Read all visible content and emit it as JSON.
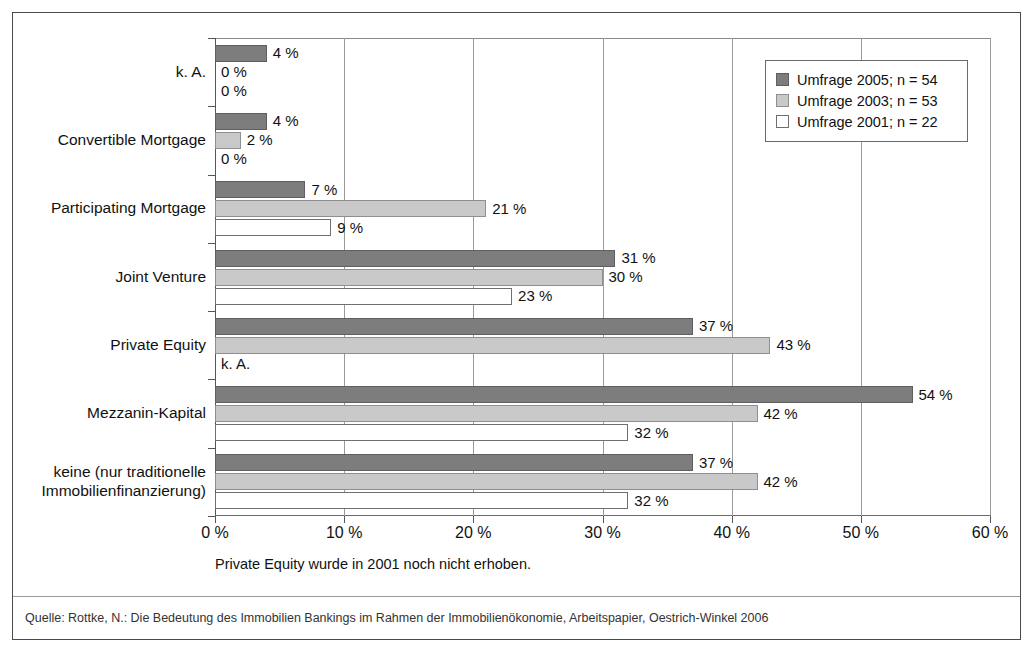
{
  "chart_data": {
    "type": "bar",
    "orientation": "horizontal",
    "title": "",
    "xlabel": "",
    "ylabel": "",
    "xlim": [
      0,
      60
    ],
    "xticks": [
      0,
      10,
      20,
      30,
      40,
      50,
      60
    ],
    "xtick_labels": [
      "0 %",
      "10 %",
      "20 %",
      "30 %",
      "40 %",
      "50 %",
      "60 %"
    ],
    "grid": true,
    "legend_position": "top-right",
    "categories": [
      "k. A.",
      "Convertible Mortgage",
      "Participating Mortgage",
      "Joint Venture",
      "Private Equity",
      "Mezzanin-Kapital",
      "keine (nur traditionelle\nImmobilienfinanzierung)"
    ],
    "series": [
      {
        "name": "Umfrage 2005; n = 54",
        "color": "#7d7d7d",
        "values": [
          4,
          4,
          7,
          31,
          37,
          54,
          37
        ],
        "labels": [
          "4 %",
          "4 %",
          "7 %",
          "31 %",
          "37 %",
          "54 %",
          "37 %"
        ]
      },
      {
        "name": "Umfrage 2003; n = 53",
        "color": "#c9c9c9",
        "values": [
          0,
          2,
          21,
          30,
          43,
          42,
          42
        ],
        "labels": [
          "0 %",
          "2 %",
          "21 %",
          "30 %",
          "43 %",
          "42 %",
          "42 %"
        ]
      },
      {
        "name": "Umfrage 2001; n = 22",
        "color": "#ffffff",
        "values": [
          0,
          0,
          9,
          23,
          null,
          32,
          32
        ],
        "labels": [
          "0 %",
          "0 %",
          "9 %",
          "23 %",
          "k. A.",
          "32 %",
          "32 %"
        ]
      }
    ],
    "footnote": "Private Equity wurde in 2001 noch nicht erhoben.",
    "source": "Quelle: Rottke, N.: Die Bedeutung des Immobilien Bankings im Rahmen der Immobilienökonomie, Arbeitspapier, Oestrich-Winkel 2006"
  },
  "legend": {
    "items": [
      {
        "label": "Umfrage 2005; n = 54",
        "series_key": "s2005"
      },
      {
        "label": "Umfrage 2003; n = 53",
        "series_key": "s2003"
      },
      {
        "label": "Umfrage 2001; n = 22",
        "series_key": "s2001"
      }
    ]
  },
  "axis": {
    "tick_labels": [
      "0 %",
      "10 %",
      "20 %",
      "30 %",
      "40 %",
      "50 %",
      "60 %"
    ]
  },
  "category_labels": [
    "k. A.",
    "Convertible Mortgage",
    "Participating Mortgage",
    "Joint Venture",
    "Private Equity",
    "Mezzanin-Kapital",
    "keine (nur traditionelle\nImmobilienfinanzierung)"
  ],
  "footnote_text": "Private Equity wurde in 2001 noch nicht erhoben.",
  "source_text": "Quelle: Rottke, N.: Die Bedeutung des Immobilien Bankings im Rahmen der Immobilienökonomie, Arbeitspapier, Oestrich-Winkel 2006"
}
